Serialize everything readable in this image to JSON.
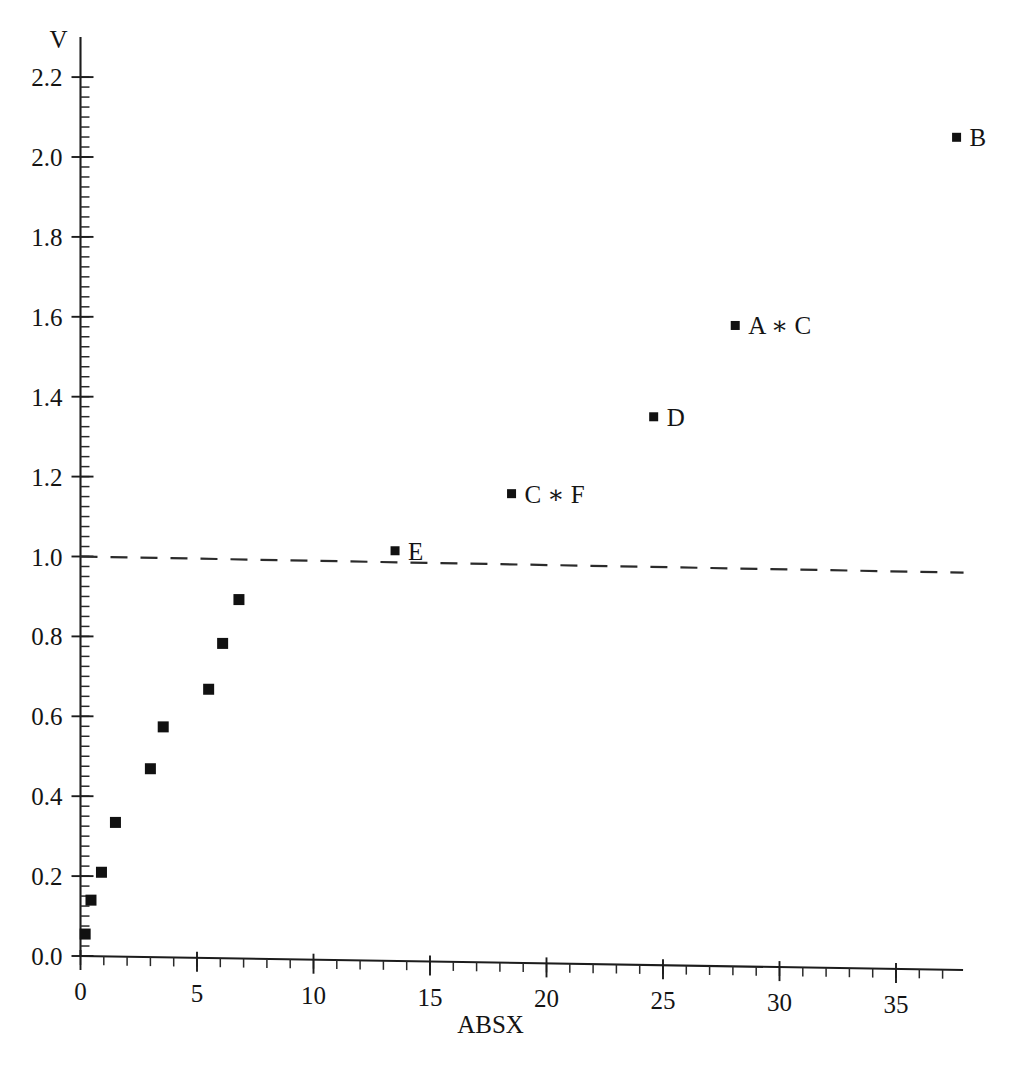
{
  "chart_data": {
    "type": "scatter",
    "title": "",
    "xlabel": "ABSX",
    "ylabel": "V",
    "xlim": [
      0,
      37.8
    ],
    "ylim": [
      0.0,
      2.2
    ],
    "grid": false,
    "legend": "none",
    "x_ticks": [
      "0",
      "5",
      "10",
      "15",
      "20",
      "25",
      "30",
      "35"
    ],
    "x_tick_values": [
      0,
      5,
      10,
      15,
      20,
      25,
      30,
      35
    ],
    "x_minor_step": 1,
    "y_ticks": [
      "0.0",
      "0.2",
      "0.4",
      "0.6",
      "0.8",
      "1.0",
      "1.2",
      "1.4",
      "1.6",
      "1.8",
      "2.0",
      "2.2"
    ],
    "y_tick_values": [
      0.0,
      0.2,
      0.4,
      0.6,
      0.8,
      1.0,
      1.2,
      1.4,
      1.6,
      1.8,
      2.0,
      2.2
    ],
    "y_minor_step": 0.025,
    "marker": "filled-square",
    "marker_color": "#111111",
    "reference_line": {
      "kind": "horizontal-dashed",
      "y": 1.0,
      "x_start": 0.0,
      "x_end": 37.9,
      "style": "dashed",
      "color": "#2b2b2b"
    },
    "points": [
      {
        "x": 0.2,
        "y": 0.055,
        "label": ""
      },
      {
        "x": 0.45,
        "y": 0.14,
        "label": ""
      },
      {
        "x": 0.9,
        "y": 0.21,
        "label": ""
      },
      {
        "x": 1.5,
        "y": 0.335,
        "label": ""
      },
      {
        "x": 3.0,
        "y": 0.47,
        "label": ""
      },
      {
        "x": 3.55,
        "y": 0.575,
        "label": ""
      },
      {
        "x": 5.5,
        "y": 0.67,
        "label": ""
      },
      {
        "x": 6.1,
        "y": 0.785,
        "label": ""
      },
      {
        "x": 6.8,
        "y": 0.895,
        "label": ""
      },
      {
        "x": 13.5,
        "y": 1.02,
        "label": "E"
      },
      {
        "x": 18.5,
        "y": 1.165,
        "label": "C ∗ F"
      },
      {
        "x": 24.6,
        "y": 1.36,
        "label": "D"
      },
      {
        "x": 28.1,
        "y": 1.59,
        "label": "A ∗ C"
      },
      {
        "x": 37.6,
        "y": 2.065,
        "label": "B"
      }
    ]
  }
}
